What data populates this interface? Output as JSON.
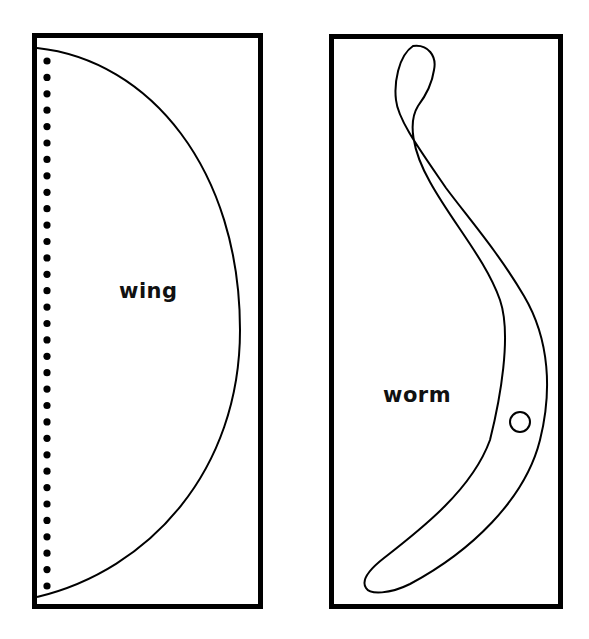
{
  "templates": [
    {
      "name": "wing",
      "label": "wing",
      "fold_line": "dotted",
      "dots": {
        "x": 47,
        "y_start": 61,
        "y_end": 586,
        "count": 33
      }
    },
    {
      "name": "worm",
      "label": "worm",
      "hole": {
        "cx": 520,
        "cy": 422,
        "r": 10
      }
    }
  ],
  "colors": {
    "stroke": "#000000",
    "background": "#ffffff"
  }
}
